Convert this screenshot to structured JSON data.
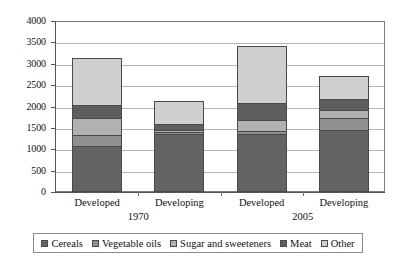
{
  "chart_data": {
    "type": "bar",
    "stacked": true,
    "title": "",
    "subtitle": "",
    "xlabel": "",
    "ylabel": "",
    "ylim": [
      0,
      4000
    ],
    "ytick_step": 500,
    "yticks": [
      "4000",
      "3500",
      "3000",
      "2500",
      "2000",
      "1500",
      "1000",
      "500",
      "0"
    ],
    "grid": true,
    "legend_position": "bottom",
    "categories": [
      "Developed",
      "Developing",
      "Developed",
      "Developing"
    ],
    "groups": [
      {
        "label": "1970",
        "categories": [
          "Developed",
          "Developing"
        ]
      },
      {
        "label": "2005",
        "categories": [
          "Developed",
          "Developing"
        ]
      }
    ],
    "series": [
      {
        "name": "Cereals",
        "color": "#636363",
        "values": [
          1050,
          1340,
          1340,
          1420
        ]
      },
      {
        "name": "Vegetable oils",
        "color": "#8f8f8f",
        "values": [
          250,
          40,
          60,
          300
        ]
      },
      {
        "name": "Sugar and sweeteners",
        "color": "#b2b2b2",
        "values": [
          410,
          60,
          250,
          180
        ]
      },
      {
        "name": "Meat",
        "color": "#5e5e5e",
        "values": [
          300,
          150,
          410,
          260
        ]
      },
      {
        "name": "Other",
        "color": "#cfcfcf",
        "values": [
          1130,
          550,
          1360,
          560
        ]
      }
    ],
    "totals": [
      3140,
      2140,
      3420,
      2720
    ]
  },
  "legend": {
    "items": [
      {
        "label": "Cereals",
        "color": "#636363"
      },
      {
        "label": "Vegetable oils",
        "color": "#8f8f8f"
      },
      {
        "label": "Sugar and sweeteners",
        "color": "#b2b2b2"
      },
      {
        "label": "Meat",
        "color": "#5e5e5e"
      },
      {
        "label": "Other",
        "color": "#cfcfcf"
      }
    ]
  }
}
